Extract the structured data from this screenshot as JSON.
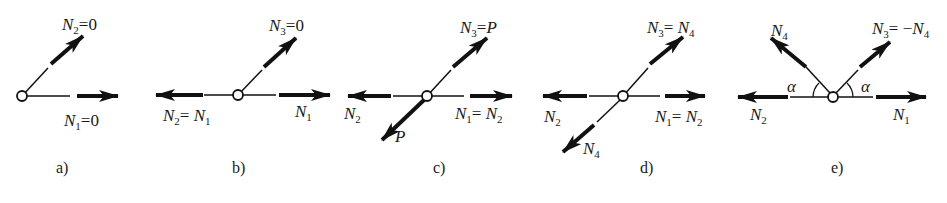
{
  "figure": {
    "panels": [
      {
        "id": "a",
        "caption": "a)",
        "labels": [
          {
            "sym": "N",
            "sub": "2",
            "rest": "=0"
          },
          {
            "sym": "N",
            "sub": "1",
            "rest": "=0"
          }
        ]
      },
      {
        "id": "b",
        "caption": "b)",
        "labels": [
          {
            "sym": "N",
            "sub": "3",
            "rest": "=0"
          },
          {
            "sym": "N",
            "sub": "2",
            "rest": "= ",
            "sym2": "N",
            "sub2": "1"
          },
          {
            "sym": "N",
            "sub": "1"
          }
        ]
      },
      {
        "id": "c",
        "caption": "c)",
        "labels": [
          {
            "sym": "N",
            "sub": "3",
            "rest": "=",
            "sym2": "P"
          },
          {
            "sym": "N",
            "sub": "2"
          },
          {
            "sym": "N",
            "sub": "1",
            "rest": "= ",
            "sym2": "N",
            "sub2": "2"
          },
          {
            "sym": "P"
          }
        ]
      },
      {
        "id": "d",
        "caption": "d)",
        "labels": [
          {
            "sym": "N",
            "sub": "3",
            "rest": "= ",
            "sym2": "N",
            "sub2": "4"
          },
          {
            "sym": "N",
            "sub": "2"
          },
          {
            "sym": "N",
            "sub": "1",
            "rest": "= ",
            "sym2": "N",
            "sub2": "2"
          },
          {
            "sym": "N",
            "sub": "4"
          }
        ]
      },
      {
        "id": "e",
        "caption": "e)",
        "labels": [
          {
            "sym": "N",
            "sub": "4"
          },
          {
            "sym": "N",
            "sub": "3",
            "rest": "= −",
            "sym2": "N",
            "sub2": "4"
          },
          {
            "sym": "α"
          },
          {
            "sym": "α"
          },
          {
            "sym": "N",
            "sub": "2"
          },
          {
            "sym": "N",
            "sub": "1"
          }
        ]
      }
    ],
    "colors": {
      "ink": "#111111",
      "background": "#ffffff"
    }
  }
}
